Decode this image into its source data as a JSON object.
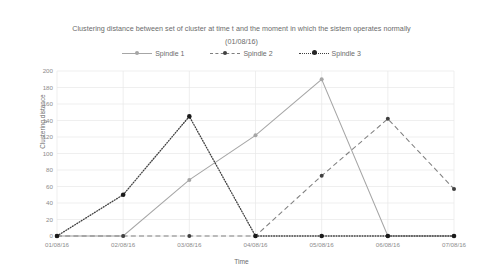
{
  "chart_data": {
    "type": "line",
    "title": "Clustering distance between set of cluster at time t and the moment in which the sistem operates normally (01/08/16)",
    "title_lines": [
      "Clustering distance between set of cluster at time t and the moment in which the sistem operates normally",
      "(01/08/16)"
    ],
    "xlabel": "Time",
    "ylabel": "Clustering distance",
    "categories": [
      "01/08/16",
      "02/08/16",
      "03/08/16",
      "04/08/16",
      "05/08/16",
      "06/08/16",
      "07/08/16"
    ],
    "series": [
      {
        "name": "Spindle 1",
        "values": [
          0,
          0,
          68,
          122,
          190,
          0,
          0
        ],
        "style": "solid",
        "color": "#a6a6a6",
        "marker_color": "#a6a6a6"
      },
      {
        "name": "Spindle 2",
        "values": [
          0,
          0,
          0,
          0,
          73,
          142,
          57
        ],
        "style": "dashed",
        "color": "#808080",
        "marker_color": "#404040"
      },
      {
        "name": "Spindle 3",
        "values": [
          0,
          50,
          145,
          0,
          0,
          0,
          0
        ],
        "style": "dotted",
        "color": "#404040",
        "marker_color": "#1a1a1a"
      }
    ],
    "ylim": [
      0,
      200
    ],
    "yticks": [
      0,
      20,
      40,
      60,
      80,
      100,
      120,
      140,
      160,
      180,
      200
    ],
    "grid": "horizontal-and-vertical",
    "grid_color": "#e8e8e8",
    "legend_position": "top-center",
    "background": "#ffffff"
  }
}
